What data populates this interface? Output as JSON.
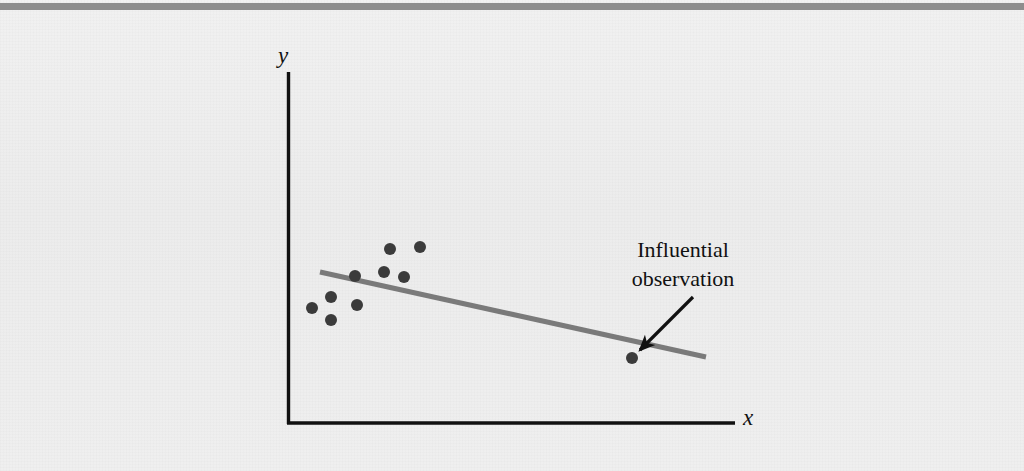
{
  "figure": {
    "kind": "scatter-plot-with-regression-line",
    "background_color": "#eeeeee",
    "top_rule_color": "#8d8d8d",
    "axis_color": "#111111",
    "point_color": "#3b3b3b",
    "line_color": "#7a7a7a",
    "arrow_color": "#111111",
    "axis_label_y": "y",
    "axis_label_x": "x",
    "annotation_line1": "Influential",
    "annotation_line2": "observation"
  },
  "chart_data": {
    "type": "scatter",
    "title": "",
    "subtitle": "",
    "xlabel": "x",
    "ylabel": "y",
    "grid": false,
    "legend": false,
    "xlim": [
      287,
      735
    ],
    "ylim": [
      424,
      72
    ],
    "axes": {
      "y_axis": {
        "x": 287,
        "y_top": 72,
        "y_bottom": 424
      },
      "x_axis": {
        "y": 424,
        "x_left": 287,
        "x_right": 735
      },
      "tick_labels_x": [],
      "tick_labels_y": []
    },
    "series": [
      {
        "name": "cluster",
        "marker": "filled-circle",
        "marker_radius": 6,
        "color": "#3b3b3b",
        "points": [
          {
            "x": 312,
            "y": 308
          },
          {
            "x": 331,
            "y": 297
          },
          {
            "x": 331,
            "y": 320
          },
          {
            "x": 355,
            "y": 276
          },
          {
            "x": 357,
            "y": 305
          },
          {
            "x": 390,
            "y": 249
          },
          {
            "x": 384,
            "y": 272
          },
          {
            "x": 404,
            "y": 277
          },
          {
            "x": 420,
            "y": 247
          }
        ]
      },
      {
        "name": "influential-observation",
        "marker": "filled-circle",
        "marker_radius": 6,
        "color": "#3b3b3b",
        "points": [
          {
            "x": 632,
            "y": 358
          }
        ]
      }
    ],
    "regression_line": {
      "name": "least-squares-line",
      "color": "#7a7a7a",
      "width": 5,
      "x1": 320,
      "y1": 272,
      "x2": 706,
      "y2": 357
    },
    "annotations": [
      {
        "name": "influential-observation-callout",
        "text_line1": "Influential",
        "text_line2": "observation",
        "text_x": 683,
        "text_y": 255,
        "arrow_from_x": 693,
        "arrow_from_y": 297,
        "arrow_to_x": 638,
        "arrow_to_y": 352
      }
    ]
  }
}
